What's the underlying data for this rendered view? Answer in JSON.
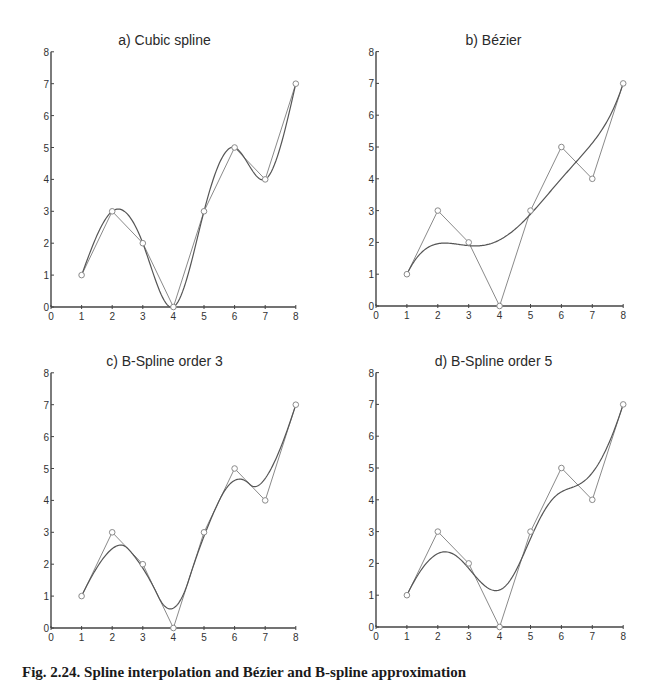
{
  "caption": "Fig. 2.24. Spline interpolation and Bézier and B-spline approximation",
  "colors": {
    "axis": "#444444",
    "control_polygon": "#8a8a8a",
    "curve": "#555555",
    "marker": "#8a8a8a",
    "text": "#2a2a2a"
  },
  "chart_data": [
    {
      "type": "line",
      "title": "a) Cubic spline",
      "method": "cubic-spline",
      "control_points": {
        "x": [
          1,
          2,
          3,
          4,
          5,
          6,
          7,
          8
        ],
        "y": [
          1,
          3,
          2,
          0,
          3,
          5,
          4,
          7
        ]
      },
      "xlabel": "",
      "ylabel": "",
      "xlim": [
        0,
        8
      ],
      "ylim": [
        0,
        8
      ],
      "xticks": [
        0,
        1,
        2,
        3,
        4,
        5,
        6,
        7,
        8
      ],
      "yticks": [
        0,
        1,
        2,
        3,
        4,
        5,
        6,
        7,
        8
      ],
      "grid": false,
      "legend": null
    },
    {
      "type": "line",
      "title": "b) Bézier",
      "method": "bezier",
      "control_points": {
        "x": [
          1,
          2,
          3,
          4,
          5,
          6,
          7,
          8
        ],
        "y": [
          1,
          3,
          2,
          0,
          3,
          5,
          4,
          7
        ]
      },
      "xlabel": "",
      "ylabel": "",
      "xlim": [
        0,
        8
      ],
      "ylim": [
        0,
        8
      ],
      "xticks": [
        0,
        1,
        2,
        3,
        4,
        5,
        6,
        7,
        8
      ],
      "yticks": [
        0,
        1,
        2,
        3,
        4,
        5,
        6,
        7,
        8
      ],
      "grid": false,
      "legend": null
    },
    {
      "type": "line",
      "title": "c) B-Spline order 3",
      "method": "bspline",
      "order": 3,
      "control_points": {
        "x": [
          1,
          2,
          3,
          4,
          5,
          6,
          7,
          8
        ],
        "y": [
          1,
          3,
          2,
          0,
          3,
          5,
          4,
          7
        ]
      },
      "xlabel": "",
      "ylabel": "",
      "xlim": [
        0,
        8
      ],
      "ylim": [
        0,
        8
      ],
      "xticks": [
        0,
        1,
        2,
        3,
        4,
        5,
        6,
        7,
        8
      ],
      "yticks": [
        0,
        1,
        2,
        3,
        4,
        5,
        6,
        7,
        8
      ],
      "grid": false,
      "legend": null
    },
    {
      "type": "line",
      "title": "d) B-Spline order 5",
      "method": "bspline",
      "order": 5,
      "control_points": {
        "x": [
          1,
          2,
          3,
          4,
          5,
          6,
          7,
          8
        ],
        "y": [
          1,
          3,
          2,
          0,
          3,
          5,
          4,
          7
        ]
      },
      "xlabel": "",
      "ylabel": "",
      "xlim": [
        0,
        8
      ],
      "ylim": [
        0,
        8
      ],
      "xticks": [
        0,
        1,
        2,
        3,
        4,
        5,
        6,
        7,
        8
      ],
      "yticks": [
        0,
        1,
        2,
        3,
        4,
        5,
        6,
        7,
        8
      ],
      "grid": false,
      "legend": null
    }
  ]
}
